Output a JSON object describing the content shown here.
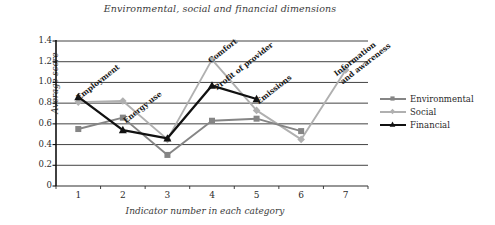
{
  "chart_data": {
    "type": "line",
    "title": "Environmental, social and financial dimensions",
    "xlabel": "Indicator number in each category",
    "ylabel": "Average score",
    "x": [
      1,
      2,
      3,
      4,
      5,
      6,
      7
    ],
    "xticklabels": [
      "1",
      "2",
      "3",
      "4",
      "5",
      "6",
      "7"
    ],
    "yticklabels": [
      "0",
      "0.2",
      "0.4",
      "0.6",
      "0.8",
      "1.0",
      "1.2",
      "1.4"
    ],
    "ytickvalues": [
      0,
      0.2,
      0.4,
      0.6,
      0.8,
      1.0,
      1.2,
      1.4
    ],
    "ylim": [
      0,
      1.4
    ],
    "xlim": [
      0.5,
      7.5
    ],
    "grid": "horizontal",
    "legend_position": "right",
    "series": [
      {
        "name": "Environmental",
        "color": "#858585",
        "marker": "square",
        "values": [
          0.55,
          0.66,
          0.3,
          0.63,
          0.65,
          0.53,
          null
        ]
      },
      {
        "name": "Social",
        "color": "#b0b0b0",
        "marker": "diamond",
        "values": [
          0.81,
          0.82,
          0.45,
          1.22,
          0.73,
          0.45,
          1.12
        ]
      },
      {
        "name": "Financial",
        "color": "#111111",
        "marker": "triangle",
        "values": [
          0.86,
          0.54,
          0.46,
          0.97,
          0.84,
          null,
          null
        ]
      }
    ],
    "annotations": [
      {
        "text": "Employment",
        "x": 1,
        "y": 0.86
      },
      {
        "text": "Energy use",
        "x": 2,
        "y": 0.66
      },
      {
        "text": "Comfort",
        "x": 4,
        "y": 1.22
      },
      {
        "text": "Profit of provider",
        "x": 4,
        "y": 0.97
      },
      {
        "text": "Emissions",
        "x": 5,
        "y": 0.84
      },
      {
        "text": "Information and awareness",
        "x": 7,
        "y": 1.12
      }
    ]
  }
}
